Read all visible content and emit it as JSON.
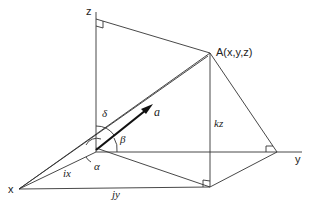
{
  "diagram": {
    "type": "3d-vector-direction-angles",
    "axes": {
      "x": "x",
      "y": "y",
      "z": "z"
    },
    "point_label": "A(x,y,z)",
    "vector_label": "a",
    "angles": {
      "alpha": "α",
      "beta": "β",
      "delta": "δ"
    },
    "components": {
      "ix": "ix",
      "jy": "jy",
      "kz": "kz"
    },
    "colors": {
      "line": "#333333",
      "background": "#ffffff"
    }
  }
}
